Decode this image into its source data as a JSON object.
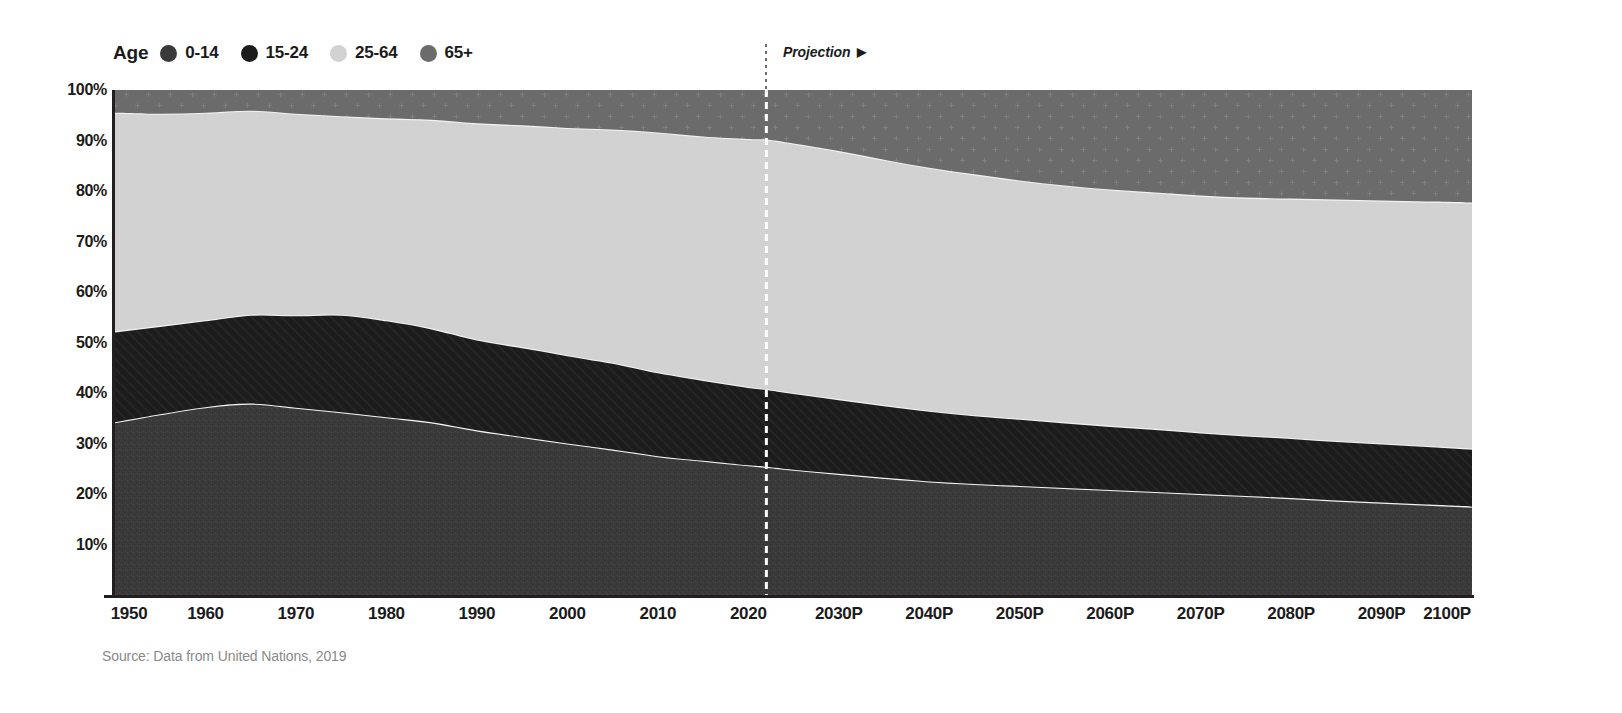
{
  "legend": {
    "title": "Age",
    "items": [
      {
        "label": "0-14",
        "color": "#3a3a3a",
        "icon": "legend-dot-icon"
      },
      {
        "label": "15-24",
        "color": "#1c1c1c",
        "icon": "legend-dot-icon"
      },
      {
        "label": "25-64",
        "color": "#d2d2d2",
        "icon": "legend-dot-icon"
      },
      {
        "label": "65+",
        "color": "#6b6b6b",
        "icon": "legend-dot-icon"
      }
    ]
  },
  "projection": {
    "label": "Projection",
    "arrow": "▶",
    "start_year": 2022,
    "line_color": "#ffffff"
  },
  "source": {
    "text": "Source: Data from United Nations, 2019"
  },
  "chart_data": {
    "type": "area",
    "stacked": true,
    "percent_stacked": true,
    "title": "",
    "subtitle": "",
    "xlabel": "",
    "ylabel": "",
    "grid": false,
    "legend_position": "top-left",
    "xlim": [
      1950,
      2100
    ],
    "ylim": [
      0,
      100
    ],
    "ytick_labels": [
      "100%",
      "90%",
      "80%",
      "70%",
      "60%",
      "50%",
      "40%",
      "30%",
      "20%",
      "10%"
    ],
    "ytick_values": [
      100,
      90,
      80,
      70,
      60,
      50,
      40,
      30,
      20,
      10
    ],
    "xtick_labels": [
      "1950",
      "1960",
      "1970",
      "1980",
      "1990",
      "2000",
      "2010",
      "2020",
      "2030P",
      "2040P",
      "2050P",
      "2060P",
      "2070P",
      "2080P",
      "2090P",
      "2100P"
    ],
    "xtick_values": [
      1950,
      1960,
      1970,
      1980,
      1990,
      2000,
      2010,
      2020,
      2030,
      2040,
      2050,
      2060,
      2070,
      2080,
      2090,
      2100
    ],
    "x": [
      1950,
      1955,
      1960,
      1965,
      1970,
      1975,
      1980,
      1985,
      1990,
      1995,
      2000,
      2005,
      2010,
      2015,
      2020,
      2022,
      2025,
      2030,
      2035,
      2040,
      2045,
      2050,
      2055,
      2060,
      2065,
      2070,
      2075,
      2080,
      2085,
      2090,
      2095,
      2100
    ],
    "series": [
      {
        "name": "0-14",
        "color": "#3a3a3a",
        "pattern": "noise",
        "values": [
          34.2,
          35.8,
          37.2,
          37.9,
          37.1,
          36.2,
          35.2,
          34.2,
          32.6,
          31.3,
          30.0,
          28.8,
          27.5,
          26.6,
          25.7,
          25.4,
          24.8,
          24.0,
          23.2,
          22.5,
          22.0,
          21.6,
          21.2,
          20.8,
          20.4,
          20.0,
          19.6,
          19.2,
          18.7,
          18.3,
          17.9,
          17.5
        ]
      },
      {
        "name": "15-24",
        "color": "#1c1c1c",
        "pattern": "diagonal-hatch",
        "values": [
          18.0,
          17.5,
          17.2,
          17.6,
          18.3,
          19.3,
          19.2,
          18.6,
          18.0,
          17.8,
          17.5,
          17.2,
          16.6,
          16.0,
          15.5,
          15.4,
          15.2,
          14.8,
          14.4,
          14.0,
          13.6,
          13.3,
          13.0,
          12.7,
          12.5,
          12.2,
          12.0,
          11.9,
          11.8,
          11.7,
          11.6,
          11.5
        ]
      },
      {
        "name": "25-64",
        "color": "#d2d2d2",
        "pattern": "flat",
        "values": [
          43.3,
          42.0,
          41.1,
          40.4,
          39.9,
          39.3,
          40.0,
          41.3,
          42.8,
          43.9,
          45.0,
          46.2,
          47.5,
          48.2,
          49.1,
          49.4,
          49.4,
          49.1,
          48.6,
          48.1,
          47.7,
          47.2,
          46.9,
          46.8,
          46.8,
          46.9,
          47.1,
          47.4,
          47.8,
          48.1,
          48.4,
          48.7
        ]
      },
      {
        "name": "65+",
        "color": "#6b6b6b",
        "pattern": "cross-plus",
        "values": [
          4.5,
          4.7,
          4.5,
          4.1,
          4.7,
          5.2,
          5.6,
          5.9,
          6.6,
          7.0,
          7.5,
          7.8,
          8.4,
          9.2,
          9.7,
          9.8,
          10.6,
          12.1,
          13.8,
          15.4,
          16.7,
          17.9,
          18.9,
          19.7,
          20.3,
          20.9,
          21.3,
          21.5,
          21.7,
          21.9,
          22.1,
          22.3
        ]
      }
    ]
  }
}
